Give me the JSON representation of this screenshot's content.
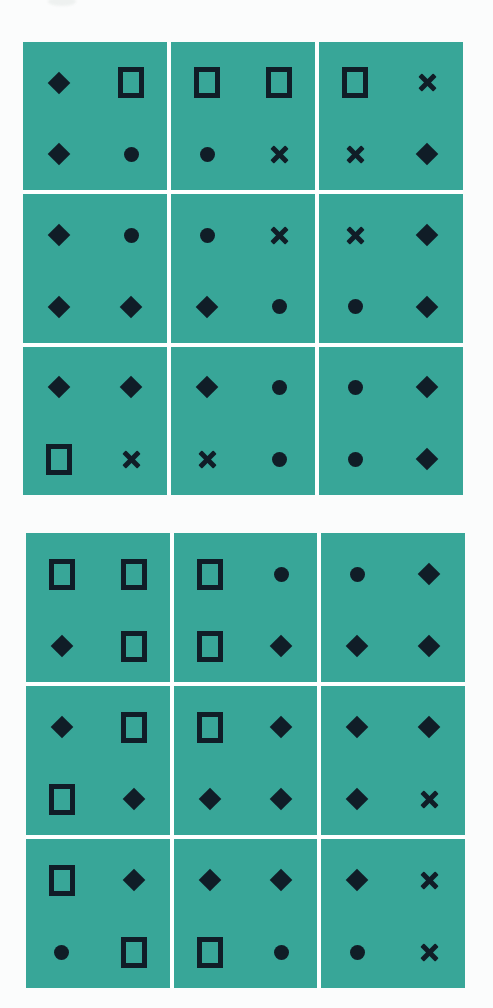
{
  "page": {
    "background_color": "#fbfcfc"
  },
  "palette": {
    "card_background": "#38a698",
    "symbol_ink": "#101d27",
    "gap_white": "#ffffff",
    "scan_smudge": "#eef1f0"
  },
  "symbol_types": [
    "diamond-icon",
    "square-icon",
    "circle-icon",
    "cross-icon"
  ],
  "symbol_order": [
    "top-left",
    "top-right",
    "bottom-left",
    "bottom-right"
  ],
  "grids": [
    {
      "name": "top-grid",
      "rows": 3,
      "cols": 3,
      "cells": [
        {
          "symbols": [
            "diamond",
            "square",
            "diamond",
            "circle"
          ]
        },
        {
          "symbols": [
            "square",
            "square",
            "circle",
            "cross"
          ]
        },
        {
          "symbols": [
            "square",
            "cross",
            "cross",
            "diamond"
          ]
        },
        {
          "symbols": [
            "diamond",
            "circle",
            "diamond",
            "diamond"
          ]
        },
        {
          "symbols": [
            "circle",
            "cross",
            "diamond",
            "circle"
          ]
        },
        {
          "symbols": [
            "cross",
            "diamond",
            "circle",
            "diamond"
          ]
        },
        {
          "symbols": [
            "diamond",
            "diamond",
            "square",
            "cross"
          ]
        },
        {
          "symbols": [
            "diamond",
            "circle",
            "cross",
            "circle"
          ]
        },
        {
          "symbols": [
            "circle",
            "diamond",
            "circle",
            "diamond"
          ]
        }
      ]
    },
    {
      "name": "bottom-grid",
      "rows": 3,
      "cols": 3,
      "cells": [
        {
          "symbols": [
            "square",
            "square",
            "diamond",
            "square"
          ]
        },
        {
          "symbols": [
            "square",
            "circle",
            "square",
            "diamond"
          ]
        },
        {
          "symbols": [
            "circle",
            "diamond",
            "diamond",
            "diamond"
          ]
        },
        {
          "symbols": [
            "diamond",
            "square",
            "square",
            "diamond"
          ]
        },
        {
          "symbols": [
            "square",
            "diamond",
            "diamond",
            "diamond"
          ]
        },
        {
          "symbols": [
            "diamond",
            "diamond",
            "diamond",
            "cross"
          ]
        },
        {
          "symbols": [
            "square",
            "diamond",
            "circle",
            "square"
          ]
        },
        {
          "symbols": [
            "diamond",
            "diamond",
            "square",
            "circle"
          ]
        },
        {
          "symbols": [
            "diamond",
            "cross",
            "circle",
            "cross"
          ]
        }
      ]
    }
  ]
}
